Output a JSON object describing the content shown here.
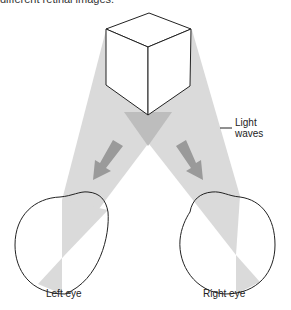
{
  "caption": "different retinal images.",
  "labels": {
    "light_waves_line1": "Light",
    "light_waves_line2": "waves",
    "left_eye": "Left eye",
    "right_eye": "Right eye"
  },
  "colors": {
    "beam": "#d9d9d9",
    "beam_overlap": "#bdbdbd",
    "arrow": "#9a9a9a",
    "outline": "#222222"
  }
}
